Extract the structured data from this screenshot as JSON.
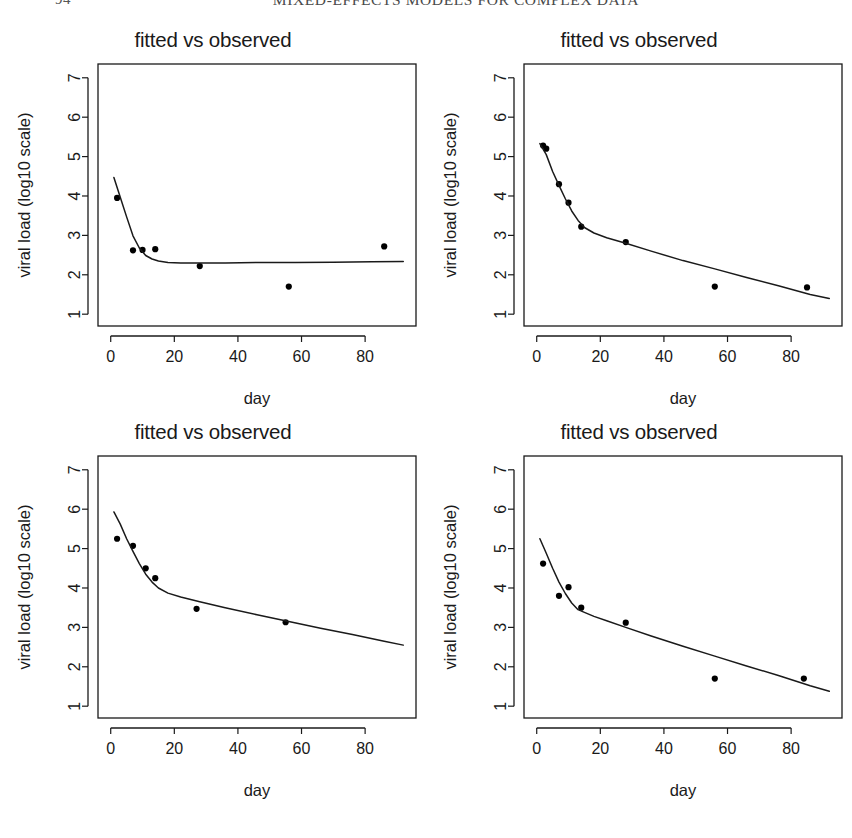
{
  "header": {
    "folio": "94",
    "title": "MIXED-EFFECTS MODELS FOR COMPLEX DATA"
  },
  "common": {
    "title": "fitted vs observed",
    "xlabel": "day",
    "ylabel": "viral load (log10 scale)",
    "xticks": [
      "0",
      "20",
      "40",
      "60",
      "80"
    ],
    "yticks": [
      "1",
      "2",
      "3",
      "4",
      "5",
      "6",
      "7"
    ]
  },
  "chart_data": [
    {
      "type": "scatter",
      "panel": "top-left",
      "title": "fitted vs observed",
      "xlabel": "day",
      "ylabel": "viral load (log10 scale)",
      "xlim": [
        -4,
        96
      ],
      "ylim": [
        0.7,
        7.35
      ],
      "xticks": [
        0,
        20,
        40,
        60,
        80
      ],
      "yticks": [
        1,
        2,
        3,
        4,
        5,
        6,
        7
      ],
      "grid": false,
      "legend": null,
      "series": [
        {
          "name": "observed",
          "type": "scatter",
          "x": [
            2,
            7,
            10,
            14,
            28,
            56,
            86
          ],
          "y": [
            3.95,
            2.62,
            2.63,
            2.65,
            2.22,
            1.7,
            2.72
          ]
        },
        {
          "name": "fitted",
          "type": "line",
          "x": [
            1,
            3,
            5,
            7,
            9,
            11,
            13,
            15,
            18,
            22,
            28,
            36,
            46,
            58,
            70,
            82,
            92
          ],
          "y": [
            4.47,
            3.97,
            3.47,
            2.99,
            2.68,
            2.49,
            2.4,
            2.35,
            2.31,
            2.3,
            2.3,
            2.3,
            2.31,
            2.31,
            2.32,
            2.33,
            2.34
          ]
        }
      ]
    },
    {
      "type": "scatter",
      "panel": "top-right",
      "title": "fitted vs observed",
      "xlabel": "day",
      "ylabel": "viral load (log10 scale)",
      "xlim": [
        -4,
        96
      ],
      "ylim": [
        0.7,
        7.35
      ],
      "xticks": [
        0,
        20,
        40,
        60,
        80
      ],
      "yticks": [
        1,
        2,
        3,
        4,
        5,
        6,
        7
      ],
      "grid": false,
      "legend": null,
      "series": [
        {
          "name": "observed",
          "type": "scatter",
          "x": [
            2,
            3,
            7,
            10,
            14,
            28,
            56,
            85
          ],
          "y": [
            5.28,
            5.2,
            4.3,
            3.83,
            3.22,
            2.83,
            1.7,
            1.68
          ]
        },
        {
          "name": "fitted",
          "type": "line",
          "x": [
            1,
            3,
            5,
            7,
            9,
            11,
            13,
            15,
            18,
            22,
            28,
            36,
            46,
            56,
            66,
            76,
            86,
            92
          ],
          "y": [
            5.33,
            5.05,
            4.62,
            4.27,
            3.93,
            3.62,
            3.38,
            3.2,
            3.06,
            2.94,
            2.8,
            2.6,
            2.36,
            2.15,
            1.93,
            1.72,
            1.5,
            1.4
          ]
        }
      ]
    },
    {
      "type": "scatter",
      "panel": "bottom-left",
      "title": "fitted vs observed",
      "xlabel": "day",
      "ylabel": "viral load (log10 scale)",
      "xlim": [
        -4,
        96
      ],
      "ylim": [
        0.7,
        7.35
      ],
      "xticks": [
        0,
        20,
        40,
        60,
        80
      ],
      "yticks": [
        1,
        2,
        3,
        4,
        5,
        6,
        7
      ],
      "grid": false,
      "legend": null,
      "series": [
        {
          "name": "observed",
          "type": "scatter",
          "x": [
            2,
            7,
            11,
            14,
            27,
            55
          ],
          "y": [
            5.25,
            5.07,
            4.5,
            4.25,
            3.47,
            3.13
          ]
        },
        {
          "name": "fitted",
          "type": "line",
          "x": [
            1,
            3,
            5,
            7,
            9,
            11,
            13,
            15,
            18,
            22,
            28,
            36,
            46,
            56,
            66,
            76,
            86,
            92
          ],
          "y": [
            5.93,
            5.62,
            5.25,
            4.93,
            4.62,
            4.35,
            4.15,
            4.0,
            3.87,
            3.77,
            3.65,
            3.5,
            3.32,
            3.15,
            2.98,
            2.82,
            2.65,
            2.55
          ]
        }
      ]
    },
    {
      "type": "scatter",
      "panel": "bottom-right",
      "title": "fitted vs observed",
      "xlabel": "day",
      "ylabel": "viral load (log10 scale)",
      "xlim": [
        -4,
        96
      ],
      "ylim": [
        0.7,
        7.35
      ],
      "xticks": [
        0,
        20,
        40,
        60,
        80
      ],
      "yticks": [
        1,
        2,
        3,
        4,
        5,
        6,
        7
      ],
      "grid": false,
      "legend": null,
      "series": [
        {
          "name": "observed",
          "type": "scatter",
          "x": [
            2,
            7,
            10,
            14,
            28,
            56,
            84
          ],
          "y": [
            4.62,
            3.8,
            4.02,
            3.5,
            3.12,
            1.7,
            1.7
          ]
        },
        {
          "name": "fitted",
          "type": "line",
          "x": [
            1,
            3,
            5,
            7,
            9,
            11,
            13,
            15,
            18,
            22,
            28,
            36,
            46,
            56,
            66,
            76,
            86,
            92
          ],
          "y": [
            5.25,
            4.88,
            4.5,
            4.15,
            3.86,
            3.62,
            3.45,
            3.38,
            3.28,
            3.17,
            3.0,
            2.78,
            2.52,
            2.27,
            2.02,
            1.78,
            1.52,
            1.38
          ]
        }
      ]
    }
  ]
}
